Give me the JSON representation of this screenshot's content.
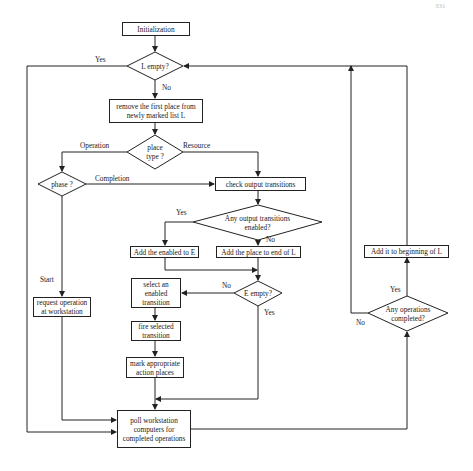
{
  "page_header": {
    "left": "",
    "right": "331"
  },
  "flowchart": {
    "nodes": {
      "init": "Initialization",
      "l_empty": "L empty?",
      "remove_first": "remove the first place from\nnewly marked list L",
      "place_type": "place\ntype ?",
      "phase": "phase ?",
      "check_output": "check output transitions",
      "any_output_enabled": "Any output transitions\nenabled?",
      "add_enabled_to_e": "Add the enabled to E",
      "add_place_end_l": "Add the place to  end of L",
      "e_empty": "E empty?",
      "select_transition": "select an\nenabled\ntransition",
      "fire_transition": "fire selected\ntransition",
      "mark_action": "mark appropriate\naction places",
      "request_operation": "request operation\nat workstation",
      "poll_workstation": "poll workstation\ncomputers for\ncompleted operations",
      "add_begin_l": "Add it to beginning of L",
      "any_ops_completed": "Any operations\ncompleted?"
    },
    "edge_labels": {
      "l_empty_yes": "Yes",
      "l_empty_no": "No",
      "operation": "Operation",
      "resource": "Resource",
      "completion": "Completion",
      "start": "Start",
      "any_output_yes": "Yes",
      "any_output_no": "No",
      "e_empty_no": "No",
      "e_empty_yes": "Yes",
      "ops_completed_yes": "Yes",
      "ops_completed_no": "No"
    },
    "colors": {
      "line": "#222222",
      "background": "#ffffff"
    }
  }
}
